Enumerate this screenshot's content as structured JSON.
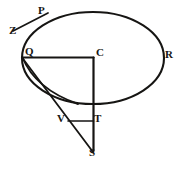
{
  "figure": {
    "background_color": "#ffffff",
    "ink_color": "#161513",
    "labels": [
      {
        "id": "P",
        "text": "P",
        "x": 38,
        "y": 5
      },
      {
        "id": "Z",
        "text": "Z",
        "x": 9,
        "y": 25
      },
      {
        "id": "Q",
        "text": "Q",
        "x": 25,
        "y": 46
      },
      {
        "id": "C",
        "text": "C",
        "x": 96,
        "y": 47
      },
      {
        "id": "R",
        "text": "R",
        "x": 165,
        "y": 49
      },
      {
        "id": "V",
        "text": "V",
        "x": 57,
        "y": 113
      },
      {
        "id": "T",
        "text": "T",
        "x": 94,
        "y": 113
      },
      {
        "id": "S",
        "text": "S",
        "x": 89,
        "y": 147
      }
    ],
    "shapes": [
      {
        "id": "main-ellipse",
        "type": "ellipse",
        "cx": 93,
        "cy": 58,
        "rx": 71,
        "ry": 46
      },
      {
        "id": "section-arc",
        "type": "arc",
        "from": "Q",
        "to": "ellipse-bottom"
      },
      {
        "id": "tangent-line-zp",
        "type": "line",
        "from": "Z",
        "to": "P"
      },
      {
        "id": "radius-qc",
        "type": "line",
        "from": "Q",
        "to": "C"
      },
      {
        "id": "axis-cs",
        "type": "line",
        "from": "C",
        "to": "S"
      },
      {
        "id": "chord-qs",
        "type": "line",
        "from": "Q",
        "to": "S"
      },
      {
        "id": "ordinate-vt",
        "type": "line",
        "from": "V",
        "to": "T"
      }
    ]
  }
}
